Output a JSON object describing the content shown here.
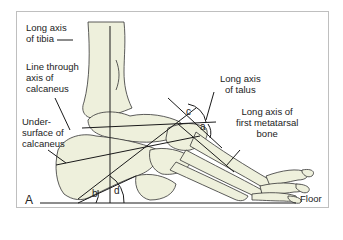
{
  "figure": {
    "panel_label": "A",
    "colors": {
      "bone_fill": "#eef0dc",
      "line": "#1a1a1a",
      "frame": "#bfbfbf"
    },
    "labels": {
      "tibia_axis": "Long axis\nof tibia",
      "calcaneus_axis": "Line through\naxis of\ncalcaneus",
      "calcaneus_undersurface": "Under-\nsurface of\ncalcaneus",
      "talus_axis": "Long axis\nof talus",
      "first_metatarsal_axis": "Long axis of\nfirst metatarsal\nbone",
      "floor": "Floor"
    },
    "angles": {
      "a": "a",
      "b": "b",
      "c": "c",
      "d": "d"
    }
  }
}
